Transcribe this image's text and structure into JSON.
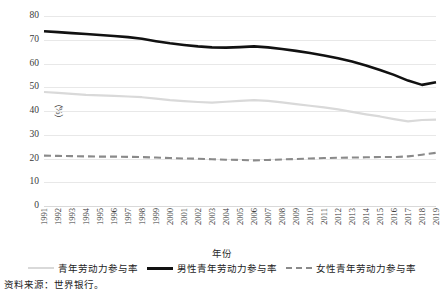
{
  "chart_data": {
    "type": "line",
    "title": "",
    "xlabel": "年份",
    "ylabel": "（%）",
    "ylim": [
      0,
      80
    ],
    "yticks": [
      80,
      70,
      60,
      50,
      40,
      30,
      20,
      10,
      0
    ],
    "grid": true,
    "legend_position": "bottom",
    "categories": [
      "1991",
      "1992",
      "1993",
      "1994",
      "1995",
      "1996",
      "1997",
      "1998",
      "1999",
      "2000",
      "2001",
      "2002",
      "2003",
      "2004",
      "2005",
      "2006",
      "2007",
      "2008",
      "2009",
      "2010",
      "2011",
      "2012",
      "2013",
      "2014",
      "2015",
      "2016",
      "2017",
      "2018",
      "2019"
    ],
    "series": [
      {
        "name": "青年劳动力参与率",
        "style": "solid",
        "color": "#d9d9d9",
        "values": [
          48.0,
          47.6,
          47.2,
          46.8,
          46.6,
          46.4,
          46.1,
          45.8,
          45.2,
          44.6,
          44.2,
          43.8,
          43.5,
          43.9,
          44.3,
          44.6,
          44.3,
          43.6,
          42.9,
          42.2,
          41.5,
          40.7,
          39.6,
          38.6,
          37.7,
          36.6,
          35.6,
          36.2,
          36.4
        ]
      },
      {
        "name": "男性青年劳动力参与率",
        "style": "solid",
        "color": "#111111",
        "values": [
          73.6,
          73.2,
          72.8,
          72.4,
          72.0,
          71.6,
          71.1,
          70.4,
          69.4,
          68.5,
          67.8,
          67.2,
          66.8,
          66.7,
          66.9,
          67.2,
          66.8,
          66.1,
          65.3,
          64.4,
          63.4,
          62.2,
          60.8,
          59.2,
          57.3,
          55.2,
          52.8,
          51.0,
          52.1
        ]
      },
      {
        "name": "女性青年劳动力参与率",
        "style": "dashed",
        "color": "#8a8a8a",
        "values": [
          21.2,
          21.1,
          21.0,
          20.9,
          20.8,
          20.8,
          20.7,
          20.6,
          20.4,
          20.2,
          20.0,
          19.9,
          19.7,
          19.5,
          19.4,
          19.2,
          19.4,
          19.6,
          19.8,
          20.0,
          20.2,
          20.3,
          20.4,
          20.5,
          20.6,
          20.6,
          20.9,
          21.6,
          22.4
        ]
      }
    ],
    "axis_colors": {
      "grid": "#e8e8e8",
      "text": "#3a3a3a"
    }
  },
  "legend": {
    "items": [
      {
        "label": "青年劳动力参与率",
        "icon": "line-swatch-light-solid"
      },
      {
        "label": "男性青年劳动力参与率",
        "icon": "line-swatch-dark-solid"
      },
      {
        "label": "女性青年劳动力参与率",
        "icon": "line-swatch-gray-dashed"
      }
    ]
  },
  "notes": {
    "source": "资料来源：世界银行。"
  }
}
